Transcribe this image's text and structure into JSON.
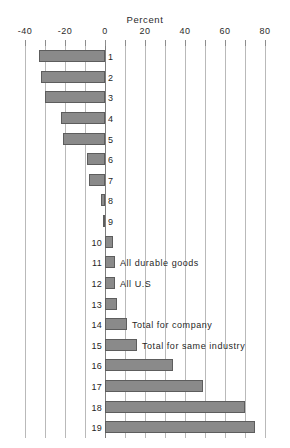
{
  "chart_data": {
    "type": "bar",
    "orientation": "horizontal",
    "title": "Percent",
    "xlabel": "Percent",
    "ylabel": "",
    "xlim": [
      -40,
      80
    ],
    "grid": true,
    "grid_step": 10,
    "legend": "none",
    "tick_labels": [
      "-40",
      "-20",
      "0",
      "20",
      "40",
      "60",
      "80"
    ],
    "tick_values": [
      -40,
      -20,
      0,
      20,
      40,
      60,
      80
    ],
    "categories": [
      "1",
      "2",
      "3",
      "4",
      "5",
      "6",
      "7",
      "8",
      "9",
      "10",
      "11",
      "12",
      "13",
      "14",
      "15",
      "16",
      "17",
      "18",
      "19"
    ],
    "values": [
      -33,
      -32,
      -30,
      -22,
      -21,
      -9,
      -8,
      -2,
      -1,
      4,
      5,
      5,
      6,
      11,
      16,
      34,
      49,
      70,
      75
    ],
    "annotations": [
      {
        "category": "11",
        "text": "All durable goods"
      },
      {
        "category": "12",
        "text": "All U.S"
      },
      {
        "category": "14",
        "text": "Total for company"
      },
      {
        "category": "15",
        "text": "Total for same industry"
      }
    ],
    "colors": {
      "bar_fill": "#8a8a8a",
      "bar_stroke": "#5d5d5d",
      "gridline": "#b9b9b9",
      "zero_line": "#7d7d7d",
      "text": "#1f1f1f",
      "background": "#ffffff"
    }
  }
}
